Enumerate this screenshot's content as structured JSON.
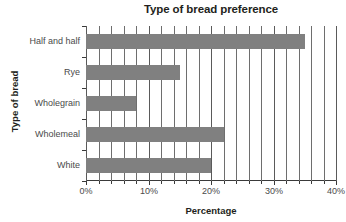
{
  "chart_data": {
    "type": "bar",
    "orientation": "horizontal",
    "title": "Type of bread preference",
    "xlabel": "Percentage",
    "ylabel": "Type of bread",
    "categories": [
      "White",
      "Wholemeal",
      "Wholegrain",
      "Rye",
      "Half and half"
    ],
    "values": [
      20,
      22,
      8,
      15,
      35
    ],
    "xlim": [
      0,
      40
    ],
    "xticks": [
      0,
      10,
      20,
      30,
      40
    ],
    "xtick_labels": [
      "0%",
      "10%",
      "20%",
      "30%",
      "40%"
    ],
    "minor_tick_step": 2,
    "grid": true,
    "legend": "none",
    "bar_color": "#808080",
    "gridline_color": "#5a5a5a",
    "axis_color": "#3a3a3a",
    "background": "#ffffff"
  }
}
